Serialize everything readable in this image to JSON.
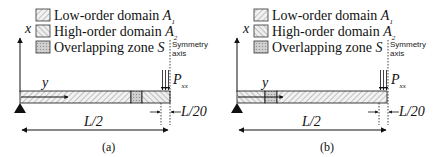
{
  "legend": [
    {
      "label": "Low-order domain ",
      "symbol": "A",
      "subscript": "1",
      "pattern": "hatch-low"
    },
    {
      "label": "High-order domain ",
      "symbol": "A",
      "subscript": "2",
      "pattern": "hatch-high"
    },
    {
      "label": "Overlapping zone ",
      "symbol": "S",
      "subscript": "",
      "pattern": "hatch-overlap"
    }
  ],
  "axis_labels": {
    "x": "x",
    "y": "y"
  },
  "symmetry_label_line1": "Symmetry",
  "symmetry_label_line2": "axis",
  "load_label": "P",
  "load_subscript": "xx",
  "dim_small": "L/20",
  "dim_large": "L/2",
  "panels": [
    {
      "caption": "(a)",
      "layout": "low-order left, overlap near load, high-order right"
    },
    {
      "caption": "(b)",
      "layout": "high-order left, overlap near support, low-order right"
    }
  ],
  "colors": {
    "line": "#111111",
    "hatch": "#555555",
    "fill_overlap": "#bdbdbd"
  }
}
